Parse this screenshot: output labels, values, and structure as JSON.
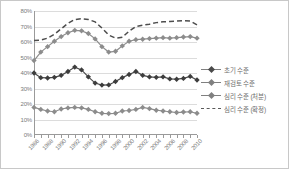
{
  "chart_data": {
    "type": "line",
    "title": "",
    "xlabel": "",
    "ylabel": "",
    "ylim": [
      0,
      80
    ],
    "yticks": [
      "0%",
      "10%",
      "20%",
      "30%",
      "40%",
      "50%",
      "60%",
      "70%",
      "80%"
    ],
    "grid": true,
    "legend_position": "right",
    "x": [
      1986,
      1987,
      1988,
      1989,
      1990,
      1991,
      1992,
      1993,
      1994,
      1995,
      1996,
      1997,
      1998,
      1999,
      2000,
      2001,
      2002,
      2003,
      2004,
      2005,
      2006,
      2007,
      2008,
      2009,
      2010
    ],
    "xtick_labels": [
      "1986",
      "1988",
      "1990",
      "1992",
      "1994",
      "1996",
      "1998",
      "2000",
      "2002",
      "2004",
      "2006",
      "2008",
      "2010"
    ],
    "series": [
      {
        "name": "초기 수준",
        "style": "solid-dark-marker",
        "values": [
          40.0,
          37.0,
          36.8,
          37.2,
          38.5,
          41.0,
          43.8,
          42.0,
          37.5,
          33.5,
          32.2,
          32.3,
          34.5,
          37.0,
          39.0,
          41.0,
          38.5,
          37.5,
          37.2,
          37.5,
          36.2,
          36.0,
          36.5,
          37.8,
          35.5
        ]
      },
      {
        "name": "재검토 수준",
        "style": "solid-light-marker",
        "values": [
          48.0,
          53.5,
          57.0,
          60.5,
          63.5,
          66.0,
          67.5,
          67.2,
          65.5,
          62.0,
          57.0,
          53.5,
          54.0,
          57.5,
          60.5,
          61.5,
          61.8,
          62.2,
          62.5,
          62.8,
          62.5,
          62.8,
          63.2,
          63.5,
          62.5
        ]
      },
      {
        "name": "심리 수준 (처분)",
        "style": "solid-light-marker",
        "values": [
          17.8,
          16.5,
          15.5,
          15.0,
          16.8,
          17.5,
          17.8,
          17.5,
          16.5,
          15.0,
          14.0,
          13.8,
          14.0,
          15.5,
          15.8,
          16.5,
          17.8,
          17.0,
          16.0,
          15.5,
          15.0,
          14.5,
          14.8,
          15.0,
          14.0
        ]
      },
      {
        "name": "심리 수준 (확정)",
        "style": "dashed",
        "values": [
          61.0,
          61.2,
          62.5,
          65.0,
          68.5,
          72.0,
          74.5,
          75.0,
          74.5,
          73.0,
          69.0,
          64.5,
          62.5,
          63.0,
          67.0,
          70.0,
          70.8,
          71.5,
          72.5,
          73.0,
          73.2,
          73.5,
          73.8,
          73.5,
          71.0
        ]
      }
    ]
  },
  "legend": {
    "items": [
      {
        "label": "초기 수준"
      },
      {
        "label": "재검토 수준"
      },
      {
        "label": "심리 수준 (처분)"
      },
      {
        "label": "심리 수준 (확정)"
      }
    ]
  }
}
